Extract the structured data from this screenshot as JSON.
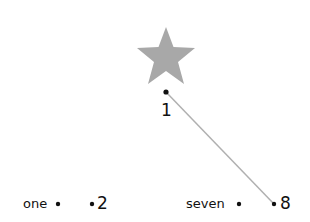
{
  "diagram": {
    "star": {
      "color": "#a8a8a8"
    },
    "connector": {
      "color": "#b0b0b0",
      "from": "1",
      "to": "8"
    },
    "nodes": [
      {
        "id": "1",
        "label": "1"
      },
      {
        "id": "one",
        "label": "one"
      },
      {
        "id": "2",
        "label": "2"
      },
      {
        "id": "seven",
        "label": "seven"
      },
      {
        "id": "8",
        "label": "8"
      }
    ]
  }
}
